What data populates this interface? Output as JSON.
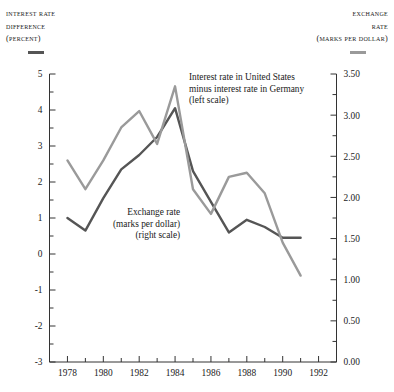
{
  "chart_data": {
    "type": "line",
    "title": "",
    "x": [
      1978,
      1979,
      1980,
      1981,
      1982,
      1983,
      1984,
      1985,
      1986,
      1987,
      1988,
      1989,
      1990,
      1991
    ],
    "xlabel": "",
    "xlim": [
      1977,
      1993
    ],
    "xticks": [
      1978,
      1979,
      1980,
      1981,
      1982,
      1983,
      1984,
      1985,
      1986,
      1987,
      1988,
      1989,
      1990,
      1991,
      1992
    ],
    "xticklabels": [
      "1978",
      "",
      "1980",
      "",
      "1982",
      "",
      "1984",
      "",
      "1986",
      "",
      "1988",
      "",
      "1990",
      "",
      "1992"
    ],
    "grid": false,
    "legend_position": "inline-annotation",
    "left_axis": {
      "label_lines": [
        "Interest rate",
        "difference",
        "(percent)"
      ],
      "ylim": [
        -3,
        5
      ],
      "yticks": [
        -3,
        -2,
        -1,
        0,
        1,
        2,
        3,
        4,
        5
      ],
      "yticklabels": [
        "-3",
        "-2",
        "-1",
        "0",
        "1",
        "2",
        "3",
        "4",
        "5"
      ],
      "minor_tick_step": 0.5,
      "color": "#555555"
    },
    "right_axis": {
      "label_lines": [
        "Exchange",
        "rate",
        "(marks per dollar)"
      ],
      "ylim": [
        0.0,
        3.5
      ],
      "yticks": [
        0.0,
        0.5,
        1.0,
        1.5,
        2.0,
        2.5,
        3.0,
        3.5
      ],
      "yticklabels": [
        "0.00",
        "0.50",
        "1.00",
        "1.50",
        "2.00",
        "2.50",
        "3.00",
        "3.50"
      ],
      "minor_tick_step": 0.25,
      "color": "#9a9a9a"
    },
    "series": [
      {
        "name": "Interest rate in United States minus interest rate in Germany (left scale)",
        "axis": "left",
        "color": "#555555",
        "annotation_lines": [
          "Interest rate in United States",
          "minus interest rate in Germany",
          "(left scale)"
        ],
        "values": [
          1.0,
          0.65,
          1.55,
          2.35,
          2.75,
          3.25,
          4.05,
          2.3,
          1.45,
          0.6,
          0.95,
          0.75,
          0.45,
          0.45
        ]
      },
      {
        "name": "Exchange rate (marks per dollar) (right scale)",
        "axis": "right",
        "color": "#9a9a9a",
        "annotation_lines": [
          "Exchange rate",
          "(marks per dollar)",
          "(right scale)"
        ],
        "values": [
          2.45,
          2.1,
          2.45,
          2.85,
          3.05,
          2.65,
          3.35,
          2.1,
          1.8,
          2.25,
          2.3,
          2.05,
          1.45,
          1.05
        ]
      }
    ]
  }
}
